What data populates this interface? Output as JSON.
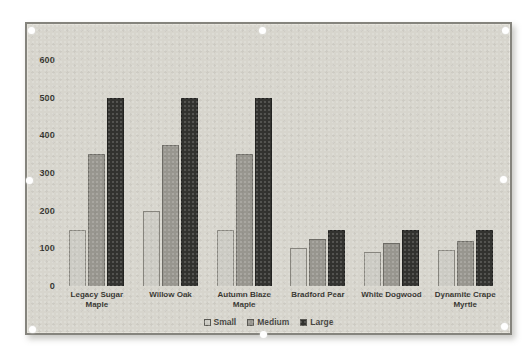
{
  "figure": {
    "state": "selected",
    "handle_count": 8,
    "chart_background": "#d7d5cd",
    "frame_border_color": "#85847d",
    "page_background": "#ffffff"
  },
  "chart_data": {
    "type": "bar",
    "title": "",
    "xlabel": "",
    "ylabel": "",
    "categories": [
      "Legacy Sugar Maple",
      "Willow Oak",
      "Autumn Blaze Maple",
      "Bradford Pear",
      "White Dogwood",
      "Dynamite Crape Myrtle"
    ],
    "series": [
      {
        "name": "Small",
        "values": [
          150,
          200,
          150,
          100,
          90,
          95
        ],
        "color": "#cccbc4",
        "border": "#87857e"
      },
      {
        "name": "Medium",
        "values": [
          350,
          375,
          350,
          125,
          115,
          120
        ],
        "color": "#98968f",
        "border": "#6e6c66"
      },
      {
        "name": "Large",
        "values": [
          500,
          500,
          500,
          150,
          150,
          150
        ],
        "color": "#32322f",
        "border": "#222220"
      }
    ],
    "ylim": [
      0,
      600
    ],
    "yticks": [
      0,
      100,
      200,
      300,
      400,
      500,
      600
    ],
    "grid": false,
    "legend_position": "bottom",
    "text_color": "#35342f"
  }
}
